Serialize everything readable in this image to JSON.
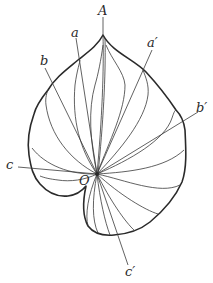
{
  "figure": {
    "type": "leaf-venation-diagram",
    "labels": {
      "apex": "A",
      "center": "O",
      "a": "a",
      "a_prime": "a′",
      "b": "b",
      "b_prime": "b′",
      "c": "c",
      "c_prime": "c′"
    },
    "colors": {
      "ink": "#2a2a2a",
      "background": "#ffffff"
    }
  }
}
